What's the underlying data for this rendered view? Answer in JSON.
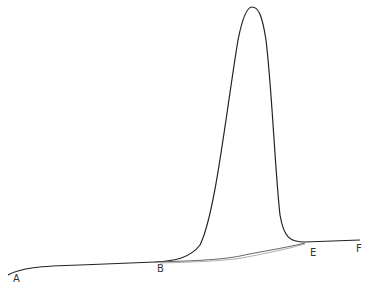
{
  "diagram": {
    "type": "chromatographic-peak",
    "labels": {
      "A": "A",
      "B": "B",
      "E": "E",
      "F": "F"
    },
    "colors": {
      "curve": "#222222",
      "baseline": "#555555",
      "text": "#333333",
      "background": "#ffffff"
    }
  }
}
